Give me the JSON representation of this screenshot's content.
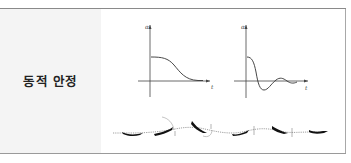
{
  "row": {
    "label": "동적 안정"
  },
  "diagrams": {
    "plot_left": {
      "y_axis_label": "α",
      "x_axis_label": "t",
      "curve": "non-oscillatory monotonic decay"
    },
    "plot_right": {
      "y_axis_label": "α",
      "x_axis_label": "t",
      "curve": "damped oscillation"
    },
    "flight_path": {
      "description": "aircraft sequence along dashed flight path showing pitch oscillation damping",
      "aircraft_count": 6
    }
  },
  "colors": {
    "label_bg": "#f4f4f4",
    "border": "#8a8a8a",
    "ink": "#222222"
  }
}
